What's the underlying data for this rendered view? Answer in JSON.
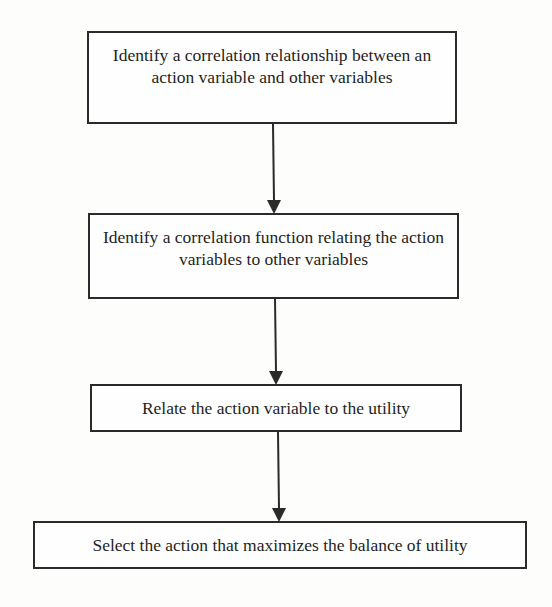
{
  "diagram": {
    "type": "flowchart",
    "direction": "top-to-bottom",
    "colors": {
      "background": "#fdfdfb",
      "line": "#2a2a2a",
      "text": "#1e1e1e"
    },
    "steps": [
      {
        "id": "step-1",
        "label": "Identify a correlation relationship between  an action variable and other variables"
      },
      {
        "id": "step-2",
        "label": "Identify a correlation function relating the action variables to other variables"
      },
      {
        "id": "step-3",
        "label": "Relate the action variable to the utility"
      },
      {
        "id": "step-4",
        "label": "Select the action that maximizes the balance of utility"
      }
    ],
    "edges": [
      {
        "from": "step-1",
        "to": "step-2"
      },
      {
        "from": "step-2",
        "to": "step-3"
      },
      {
        "from": "step-3",
        "to": "step-4"
      }
    ]
  }
}
